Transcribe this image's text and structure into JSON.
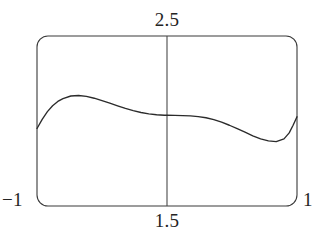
{
  "figure": {
    "background_color": "#ffffff",
    "line_color": "#2b2b2b",
    "frame_color": "#3a3a3a",
    "labels": {
      "top": "2.5",
      "bottom": "1.5",
      "left": "−1",
      "right": "1"
    }
  },
  "chart_data": {
    "type": "line",
    "title": "",
    "xlabel": "",
    "ylabel": "",
    "xlim": [
      -1,
      1
    ],
    "ylim": [
      1.5,
      2.5
    ],
    "grid": false,
    "legend": null,
    "x_tick_labels": [
      "−1",
      "1"
    ],
    "y_tick_labels": [
      "1.5",
      "2.5"
    ],
    "center_vertical_line_x": 0,
    "annotations": [
      {
        "text": "2.5",
        "position": "top-center",
        "describes": "upper y-axis bound at plot center"
      },
      {
        "text": "1.5",
        "position": "bottom-center",
        "describes": "lower y-axis bound at plot center"
      },
      {
        "text": "−1",
        "position": "bottom-left",
        "describes": "left x-axis bound"
      },
      {
        "text": "1",
        "position": "bottom-right",
        "describes": "right x-axis bound"
      }
    ],
    "series": [
      {
        "name": "curve",
        "x": [
          -1.0,
          -0.96,
          -0.92,
          -0.88,
          -0.84,
          -0.8,
          -0.74,
          -0.68,
          -0.62,
          -0.56,
          -0.5,
          -0.44,
          -0.38,
          -0.32,
          -0.26,
          -0.2,
          -0.14,
          -0.08,
          -0.02,
          0.0,
          0.06,
          0.12,
          0.18,
          0.24,
          0.3,
          0.36,
          0.42,
          0.48,
          0.54,
          0.6,
          0.66,
          0.72,
          0.78,
          0.84,
          0.9,
          0.94,
          0.97,
          1.0
        ],
        "y": [
          1.956,
          2.01,
          2.055,
          2.09,
          2.115,
          2.132,
          2.147,
          2.15,
          2.145,
          2.134,
          2.12,
          2.105,
          2.089,
          2.074,
          2.061,
          2.05,
          2.042,
          2.037,
          2.034,
          2.034,
          2.033,
          2.032,
          2.03,
          2.026,
          2.019,
          2.008,
          1.993,
          1.975,
          1.955,
          1.934,
          1.913,
          1.895,
          1.883,
          1.879,
          1.895,
          1.93,
          1.975,
          2.025
        ]
      }
    ]
  },
  "plot_geometry": {
    "frame_left": 37,
    "frame_right": 297,
    "frame_top": 36,
    "frame_bottom": 206,
    "corner_radius": 10,
    "center_line_x": 167
  }
}
